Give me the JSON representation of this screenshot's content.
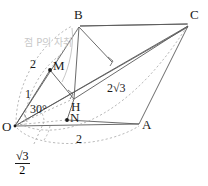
{
  "figure": {
    "type": "geometry-diagram",
    "background": "#ffffff",
    "line_color": "#555555",
    "dash_color": "#999999",
    "label_color": "#1a1a1a",
    "annotation_color": "#c9c9c9"
  },
  "vertices": [
    {
      "name": "O",
      "label": "O",
      "x": 13,
      "y": 127
    },
    {
      "name": "A",
      "label": "A",
      "x": 141,
      "y": 124
    },
    {
      "name": "B",
      "label": "B",
      "x": 80,
      "y": 22
    },
    {
      "name": "C",
      "label": "C",
      "x": 190,
      "y": 22
    },
    {
      "name": "M",
      "label": "M",
      "x": 50,
      "y": 70
    },
    {
      "name": "N",
      "label": "N",
      "x": 67,
      "y": 120
    },
    {
      "name": "H",
      "label": "H",
      "x": 74,
      "y": 97
    }
  ],
  "labels": {
    "vertex_O": "O",
    "vertex_A": "A",
    "vertex_B": "B",
    "vertex_C": "C",
    "point_M": "M",
    "point_N": "N",
    "point_H": "H",
    "len_OM_side": "2",
    "len_one": "1",
    "angle_30": "30°",
    "len_2sqrt3": "2√3",
    "len_base_2": "2",
    "frac_numerator": "√3",
    "frac_denominator": "2",
    "locus_note": "점 P의 자취"
  },
  "measurements": {
    "OM": "2",
    "OH_segment": "1",
    "angle_MOH": "30°",
    "HC": "2√3",
    "OA": "2",
    "height": "√3 / 2"
  }
}
